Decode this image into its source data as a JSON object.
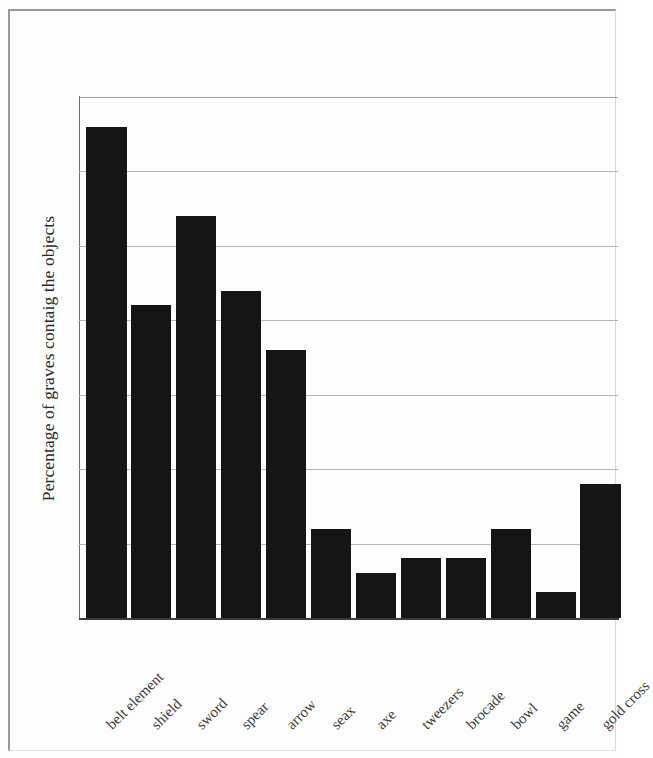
{
  "chart_data": {
    "type": "bar",
    "title": "",
    "subtitle": "",
    "xlabel": "",
    "ylabel": "Percentage of graves contaig the objects",
    "categories": [
      "belt element",
      "shield",
      "sword",
      "spear",
      "arrow",
      "seax",
      "axe",
      "tweezers",
      "brocade",
      "bowl",
      "game",
      "gold cross"
    ],
    "values": [
      3.3,
      2.1,
      2.7,
      2.2,
      1.8,
      0.6,
      0.3,
      0.4,
      0.4,
      0.6,
      0.175,
      0.9
    ],
    "value_labels": [
      "3,3%",
      "2,1%",
      "2,7%",
      "2,2%",
      "1,8%",
      "0,6%",
      "0,3%",
      "0,4%",
      "0,4%",
      "0,6%",
      "0,175%",
      "0,9%"
    ],
    "ylim": [
      0,
      3.5
    ],
    "ytick_values": [
      0.0,
      0.5,
      1.0,
      1.5,
      2.0,
      2.5,
      3.0,
      3.5
    ],
    "ytick_labels": [
      "0,0%",
      "0,5%",
      "1,0%",
      "1,5%",
      "2,0%",
      "2,5%",
      "3,0%",
      "3,5%"
    ],
    "grid": "horizontal",
    "legend": "none",
    "bar_color": "#151515",
    "gridline_color": "#b4b4b4",
    "axis_color": "#3a3a3a",
    "background_color": "#ffffff",
    "decimal_separator": ","
  }
}
